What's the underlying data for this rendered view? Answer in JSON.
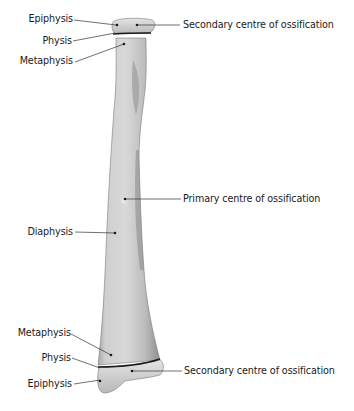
{
  "diagram": {
    "type": "anatomical-illustration",
    "labels_left_top": [
      {
        "id": "epiphysis-top",
        "text": "Epiphysis"
      },
      {
        "id": "physis-top",
        "text": "Physis"
      },
      {
        "id": "metaphysis-top",
        "text": "Metaphysis"
      }
    ],
    "labels_left_middle": [
      {
        "id": "diaphysis",
        "text": "Diaphysis"
      }
    ],
    "labels_left_bottom": [
      {
        "id": "metaphysis-bottom",
        "text": "Metaphysis"
      },
      {
        "id": "physis-bottom",
        "text": "Physis"
      },
      {
        "id": "epiphysis-bottom",
        "text": "Epiphysis"
      }
    ],
    "labels_right": [
      {
        "id": "secondary-centre-top",
        "text": "Secondary centre of ossification"
      },
      {
        "id": "primary-centre",
        "text": "Primary centre of ossification"
      },
      {
        "id": "secondary-centre-bottom",
        "text": "Secondary centre of ossification"
      }
    ],
    "colors": {
      "background": "#ffffff",
      "bone_light": "#d9d9d9",
      "bone_mid": "#b5b5b5",
      "bone_dark": "#8a8a8a",
      "physis_line": "#1a1a1a",
      "leader_line": "#333333",
      "text": "#1a1a1a"
    }
  }
}
